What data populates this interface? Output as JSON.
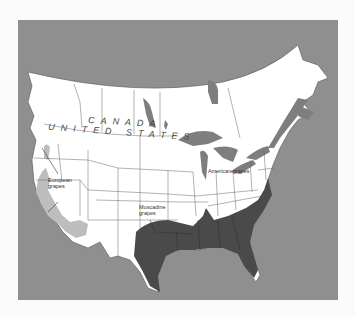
{
  "map": {
    "title": "Grape-growing regions of North America",
    "colors": {
      "water": "#8f8f8f",
      "land": "#ffffff",
      "borders": "#555555",
      "european": "#bdbdbd",
      "muscadine": "#4a4a4a",
      "lakes": "#7e7e7e",
      "page": "#fbfbfb"
    },
    "country_labels": {
      "canada": "CANADA",
      "united_states": "UNITED STATES"
    },
    "regions": [
      {
        "id": "european",
        "label_line1": "European",
        "label_line2": "grapes",
        "shade": "light gray"
      },
      {
        "id": "muscadine",
        "label_line1": "Muscadine",
        "label_line2": "grapes",
        "shade": "dark gray"
      },
      {
        "id": "american",
        "label_line1": "American grapes",
        "label_line2": "",
        "shade": "white"
      }
    ]
  }
}
